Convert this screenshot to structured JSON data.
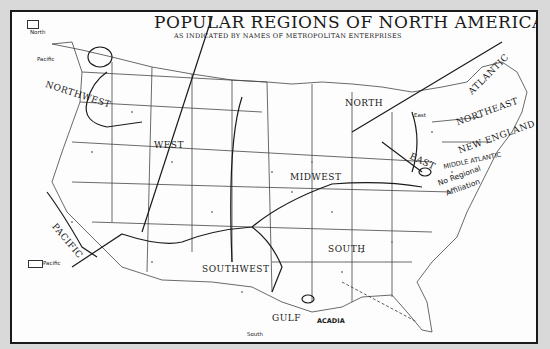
{
  "map": {
    "title": "POPULAR REGIONS OF NORTH AMERICA",
    "subtitle": "AS INDICATED BY NAMES OF METROPOLITAN ENTERPRISES",
    "regions": {
      "northwest": "NORTHWEST",
      "west": "WEST",
      "pacific": "PACIFIC",
      "southwest": "SOUTHWEST",
      "north": "NORTH",
      "midwest": "MIDWEST",
      "south": "SOUTH",
      "gulf": "GULF",
      "acadia": "ACADIA",
      "east": "EAST",
      "atlantic": "ATLANTIC",
      "northeast": "NORTHEAST",
      "new_england": "NEW ENGLAND",
      "middle_atlantic": "MIDDLE ATLANTIC"
    },
    "annotations": {
      "no_regional_line1": "No Regional",
      "no_regional_line2": "Affiliation",
      "inset_north": "North",
      "pacific_pointer": "Pacific",
      "pacific_inset": "Pacific",
      "east_pointer": "East",
      "south_pointer": "South"
    },
    "colors": {
      "background": "#d9d9d9",
      "paper": "#fdfdfd",
      "ink": "#1a1a1a",
      "line": "#333333"
    }
  }
}
